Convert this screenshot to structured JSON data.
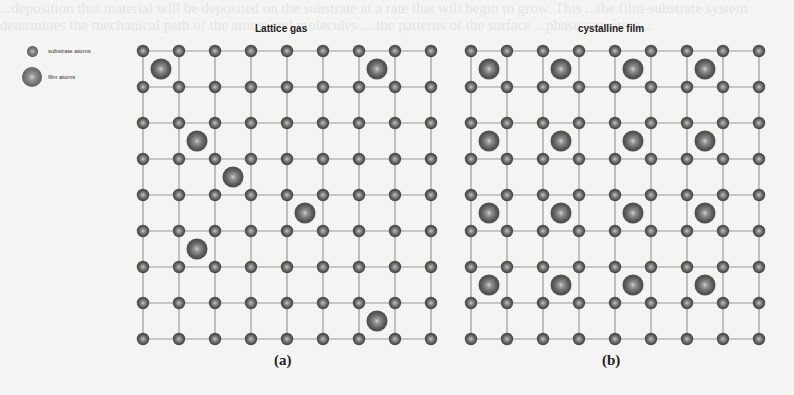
{
  "legend": {
    "substrate_label": "substrate atoms",
    "film_label": "film atoms"
  },
  "panels": [
    {
      "id": "a",
      "title": "Lattice gas",
      "caption": "(a)",
      "grid": {
        "x0": 143,
        "y0": 51,
        "spacing": 36,
        "nodes_x": 9,
        "nodes_y": 9
      },
      "film_atoms": [
        [
          0,
          0
        ],
        [
          0,
          6
        ],
        [
          2,
          1
        ],
        [
          3,
          2
        ],
        [
          4,
          4
        ],
        [
          5,
          1
        ],
        [
          7,
          6
        ]
      ]
    },
    {
      "id": "b",
      "title": "cystalline film",
      "caption": "(b)",
      "grid": {
        "x0": 471,
        "y0": 51,
        "spacing": 36,
        "nodes_x": 9,
        "nodes_y": 9
      },
      "film_atoms": [
        [
          0,
          0
        ],
        [
          0,
          2
        ],
        [
          0,
          4
        ],
        [
          0,
          6
        ],
        [
          2,
          0
        ],
        [
          2,
          2
        ],
        [
          2,
          4
        ],
        [
          2,
          6
        ],
        [
          4,
          0
        ],
        [
          4,
          2
        ],
        [
          4,
          4
        ],
        [
          4,
          6
        ],
        [
          6,
          0
        ],
        [
          6,
          2
        ],
        [
          6,
          4
        ],
        [
          6,
          6
        ]
      ]
    }
  ],
  "colors": {
    "grid_line": "#9a9a9a",
    "atom_dark": "#4a4a4a",
    "atom_mid": "#7a7a7a",
    "atom_light": "#c9c9c9"
  },
  "background_text": "...deposition that material will be deposited on the substrate at a rate that will begin to grow. This ...the film-substrate system determines the mechanical path of the atoms and molecules ... the patterns of the surface ...phase transition..."
}
